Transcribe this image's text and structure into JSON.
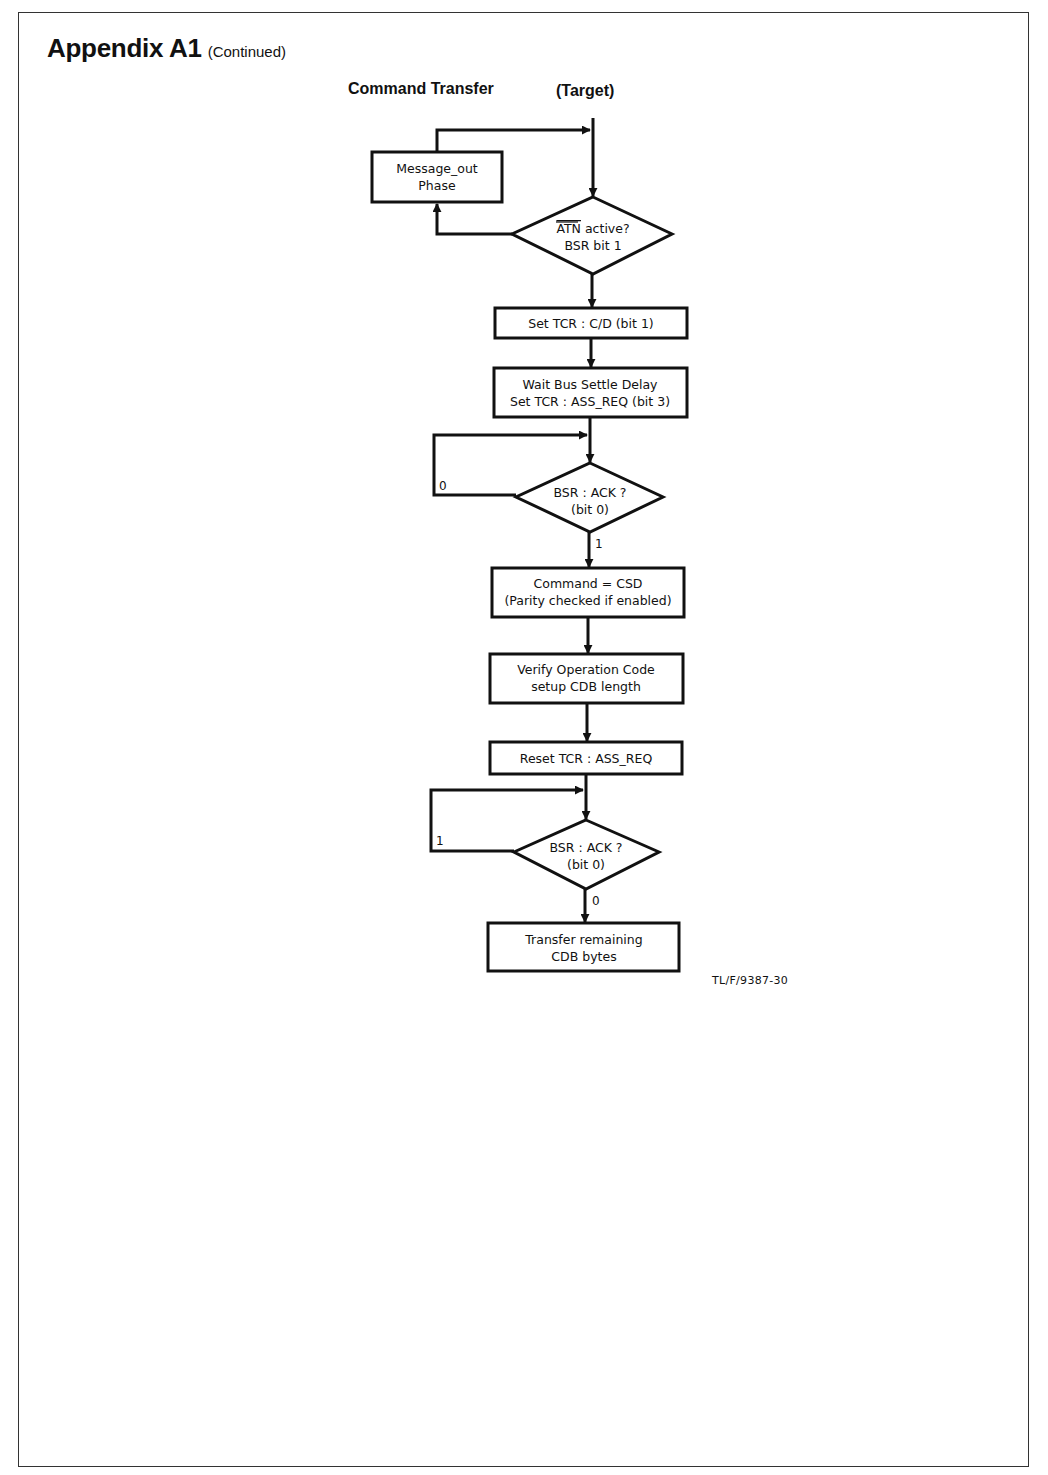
{
  "heading": {
    "title": "Appendix A1",
    "subtitle": "(Continued)"
  },
  "diagram": {
    "title_left": "Command Transfer",
    "title_right": "(Target)",
    "nodes": [
      {
        "id": "message-out",
        "type": "process",
        "lines": [
          "Message_out",
          "Phase"
        ]
      },
      {
        "id": "atn-check",
        "type": "decision",
        "lines": [
          "ATN active?",
          "BSR bit 1"
        ],
        "overline_text": "ATN"
      },
      {
        "id": "set-tcr-cd",
        "type": "process",
        "lines": [
          "Set TCR : C/D (bit 1)"
        ]
      },
      {
        "id": "wait-bus",
        "type": "process",
        "lines": [
          "Wait Bus Settle Delay",
          "Set TCR : ASS_REQ (bit 3)"
        ]
      },
      {
        "id": "ack-check-1",
        "type": "decision",
        "lines": [
          "BSR : ACK ?",
          "(bit 0)"
        ]
      },
      {
        "id": "command-csd",
        "type": "process",
        "lines": [
          "Command = CSD",
          "(Parity checked if enabled)"
        ]
      },
      {
        "id": "verify-opcode",
        "type": "process",
        "lines": [
          "Verify Operation Code",
          "setup CDB length"
        ]
      },
      {
        "id": "reset-tcr",
        "type": "process",
        "lines": [
          "Reset TCR : ASS_REQ"
        ]
      },
      {
        "id": "ack-check-2",
        "type": "decision",
        "lines": [
          "BSR : ACK ?",
          "(bit 0)"
        ]
      },
      {
        "id": "transfer-cdb",
        "type": "process",
        "lines": [
          "Transfer remaining",
          "CDB bytes"
        ]
      }
    ],
    "edge_labels": {
      "ack1_loop": "0",
      "ack1_next": "1",
      "ack2_loop": "1",
      "ack2_next": "0"
    },
    "atn_suffix": " active?",
    "figure_ref": "TL/F/9387-30"
  }
}
